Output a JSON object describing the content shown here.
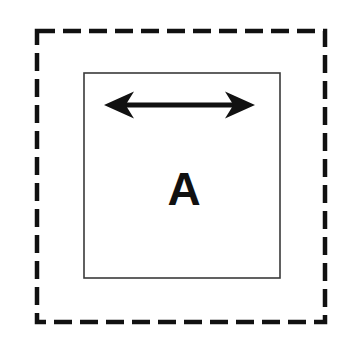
{
  "canvas": {
    "width": 352,
    "height": 346,
    "background_color": "#ffffff"
  },
  "diagram": {
    "title": "",
    "stroke_color": "#111111",
    "fill_color": "none",
    "outer_boundary": {
      "name": "outer-dashed-square",
      "shape": "rectangle",
      "style": "dashed",
      "x": 37,
      "y": 31,
      "width": 288,
      "height": 291,
      "stroke_width": 4.5,
      "dash_length": 18,
      "dash_gap": 8,
      "color": "#111111"
    },
    "inner_boundary": {
      "name": "inner-solid-square",
      "shape": "rectangle",
      "style": "solid",
      "x": 84,
      "y": 73,
      "width": 196,
      "height": 205,
      "stroke_width": 1.6,
      "color": "#3a3a3a"
    },
    "arrow": {
      "name": "double-headed-arrow",
      "orientation": "horizontal",
      "x_start": 104,
      "x_end": 255,
      "y_center": 105,
      "shaft_thickness": 5,
      "head_length": 30,
      "head_height": 27,
      "color": "#111111",
      "heads": "both"
    },
    "label": {
      "text": "A",
      "x": 184,
      "y": 205,
      "font_size": 46,
      "font_weight": "bold",
      "color": "#111111"
    }
  }
}
